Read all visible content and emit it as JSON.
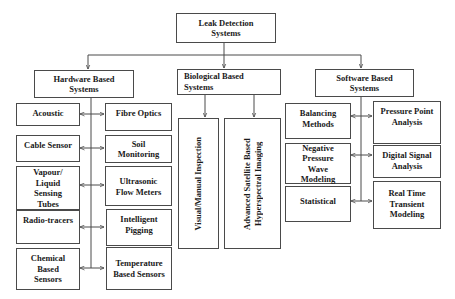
{
  "diagram": {
    "root": {
      "label": "Leak Detection Systems",
      "line1": "Leak Detection",
      "line2": "Systems"
    },
    "categories": [
      {
        "id": "hardware",
        "label": "Hardware Based Systems",
        "line1": "Hardware Based",
        "line2": "Systems",
        "left_items": [
          "Acoustic",
          "Cable Sensor",
          "Vapour/ Liquid Sensing Tubes",
          "Radio-tracers",
          "Chemical Based Sensors"
        ],
        "right_items": [
          "Fibre Optics",
          "Soil Monitoring",
          "Ultrasonic Flow Meters",
          "Intelligent Pigging",
          "Temperature Based Sensors"
        ]
      },
      {
        "id": "biological",
        "label": "Biological Based Systems",
        "line1": "Biological Based",
        "line2": "Systems",
        "items": [
          "Visual/Manual Inspection",
          "Advanced Satellite Based Hyperspectral Imaging"
        ]
      },
      {
        "id": "software",
        "label": "Software Based Systems",
        "line1": "Software Based",
        "line2": "Systems",
        "left_items": [
          "Balancing Methods",
          "Negative Pressure Wave Modeling",
          "Statistical"
        ],
        "right_items": [
          "Pressure Point Analysis",
          "Digital Signal Analysis",
          "Real Time Transient Modeling"
        ]
      }
    ],
    "colors": {
      "line": "#4a4a4a",
      "text": "#1a1a1a",
      "background": "#ffffff"
    }
  }
}
